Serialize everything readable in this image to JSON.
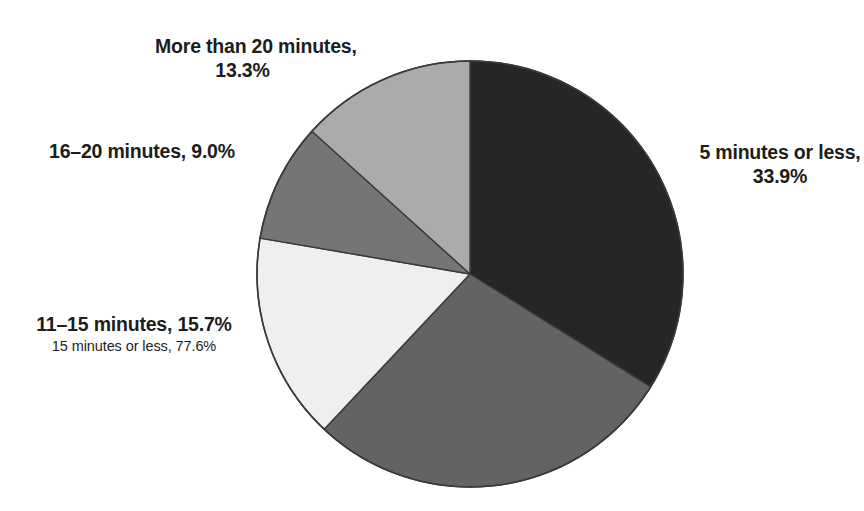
{
  "figure": {
    "background_color": "#ffffff",
    "width": 864,
    "height": 511
  },
  "pie": {
    "center_x": 470,
    "center_y": 274,
    "radius": 213,
    "outline_color": "#3a3a3a",
    "start_angle_deg": 0,
    "direction": "clockwise"
  },
  "labels": {
    "more_than_20": {
      "line1": "More than 20 minutes,",
      "line2": "13.3%"
    },
    "sixteen_to_20": {
      "line1": "16–20 minutes, 9.0%"
    },
    "five_or_less": {
      "line1": "5 minutes or less,",
      "line2": "33.9%"
    },
    "eleven_to_15": {
      "main": "11–15 minutes, 15.7%",
      "sub": "15 minutes or less, 77.6%"
    }
  },
  "chart_data": {
    "type": "pie",
    "title": "",
    "subtitle": "",
    "xlabel": "",
    "ylabel": "",
    "legend_position": "none",
    "grid": false,
    "units": "percent",
    "value_total": 100.0,
    "annotations": [
      "15 minutes or less, 77.6%"
    ],
    "categories": [
      "5 minutes or less",
      "6–10 minutes",
      "11–15 minutes",
      "16–20 minutes",
      "More than 20 minutes"
    ],
    "values": [
      33.9,
      28.1,
      15.7,
      9.0,
      13.3
    ],
    "slices": [
      {
        "label": "5 minutes or less",
        "value": 33.9,
        "value_text": "33.9%",
        "color": "#262626",
        "start_angle": 0.0,
        "end_angle": 122.0,
        "labeled": true
      },
      {
        "label": "6–10 minutes",
        "value": 28.1,
        "value_text": "",
        "color": "#636363",
        "start_angle": 122.0,
        "end_angle": 223.2,
        "labeled": false
      },
      {
        "label": "11–15 minutes",
        "value": 15.7,
        "value_text": "15.7%",
        "color": "#efefef",
        "start_angle": 223.2,
        "end_angle": 279.7,
        "labeled": true
      },
      {
        "label": "16–20 minutes",
        "value": 9.0,
        "value_text": "9.0%",
        "color": "#757575",
        "start_angle": 279.7,
        "end_angle": 312.1,
        "labeled": true
      },
      {
        "label": "More than 20 minutes",
        "value": 13.3,
        "value_text": "13.3%",
        "color": "#ababab",
        "start_angle": 312.1,
        "end_angle": 360.0,
        "labeled": true
      }
    ]
  }
}
